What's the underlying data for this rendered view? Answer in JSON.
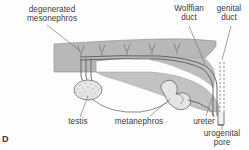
{
  "figure": {
    "panel_letter": "D",
    "type": "anatomical-diagram",
    "colors": {
      "background": "#fdfdfd",
      "body_fill": "#b8b8b8",
      "body_fill_light": "#cfcfcf",
      "outline": "#6e6e6e",
      "duct_line": "#5a5a5a",
      "leader_line": "#707070",
      "text": "#3b3b3b",
      "testis_fill": "#e2e2e2",
      "stipple": "#8a8a8a"
    },
    "labels": [
      {
        "id": "degenerated-mesonephros",
        "text_line1": "degenerated",
        "text_line2": "mesonephros"
      },
      {
        "id": "wolffian-duct",
        "text_line1": "Wolffian",
        "text_line2": "duct"
      },
      {
        "id": "genital-duct",
        "text_line1": "genital",
        "text_line2": "duct"
      },
      {
        "id": "testis",
        "text_line1": "testis"
      },
      {
        "id": "metanephros",
        "text_line1": "metanephros"
      },
      {
        "id": "ureter",
        "text_line1": "ureter"
      },
      {
        "id": "urogenital-pore",
        "text_line1": "urogenital",
        "text_line2": "pore"
      }
    ],
    "structures": {
      "degenerated_tubule_count": 5,
      "vasa_efferentia_count": 3,
      "genital_duct_style": "dashed",
      "wolffian_duct_style": "solid-double"
    }
  }
}
